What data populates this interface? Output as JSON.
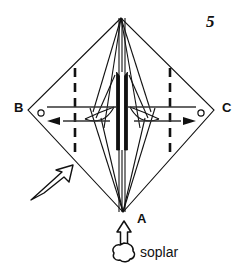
{
  "figure": {
    "step_number": "5",
    "background_color": "#ffffff",
    "line_color": "#111111",
    "vertex_labels": {
      "top": "",
      "bottom": "A",
      "left": "B",
      "right": "C"
    },
    "instruction_caption": "soplar",
    "markers": {
      "left_circle": "o",
      "right_circle": "o"
    },
    "icons": {
      "blow_arrow": "blow-arrow-icon",
      "puff_cloud": "puff-cloud-icon",
      "view_direction_arrow": "view-direction-arrow-icon",
      "left_pull_arrow": "left-pull-arrow-icon",
      "right_pull_arrow": "right-pull-arrow-icon",
      "left_fold_curve": "left-fold-curve-icon",
      "right_fold_curve": "right-fold-curve-icon",
      "left_valley_crease": "left-dashed-crease",
      "right_valley_crease": "right-dashed-crease"
    },
    "geometry": {
      "apex_top": [
        121,
        18
      ],
      "apex_bottom": [
        123,
        212
      ],
      "vertex_left": [
        28,
        110
      ],
      "vertex_right": [
        214,
        110
      ],
      "crease_x_left": 75,
      "crease_x_right": 170,
      "crease_y_top": 68,
      "crease_y_bottom": 155
    }
  }
}
